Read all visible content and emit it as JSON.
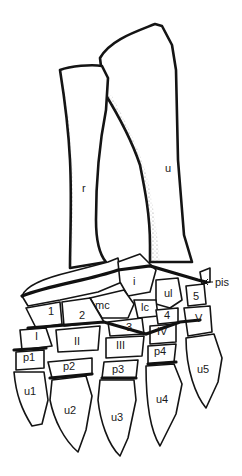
{
  "figure": {
    "type": "anatomical-illustration",
    "colors": {
      "ink": "#141414",
      "background": "#ffffff"
    }
  },
  "labels": {
    "radius": "r",
    "ulna": "u",
    "intermedium": "i",
    "ulnare": "ul",
    "pisiform": "pis",
    "medial_centrale": "mc",
    "lateral_centrale": "lc",
    "distal_carpal_1": "1",
    "distal_carpal_2": "2",
    "distal_carpal_3": "3",
    "distal_carpal_4": "4",
    "distal_carpal_5": "5",
    "metacarpal_I": "I",
    "metacarpal_II": "II",
    "metacarpal_III": "III",
    "metacarpal_IV": "IV",
    "metacarpal_V": "V",
    "phalanx_1": "p1",
    "phalanx_2": "p2",
    "phalanx_3": "p3",
    "phalanx_4": "p4",
    "ungual_1": "u1",
    "ungual_2": "u2",
    "ungual_3": "u3",
    "ungual_4": "u4",
    "ungual_5": "u5"
  }
}
